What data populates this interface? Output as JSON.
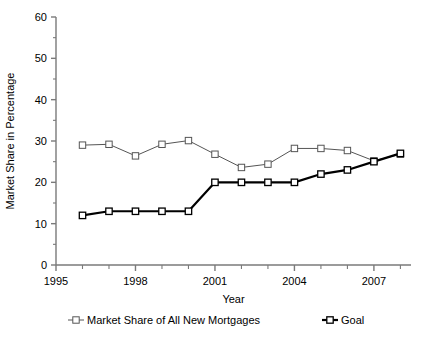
{
  "chart_data": {
    "type": "line",
    "title": "",
    "xlabel": "Year",
    "ylabel": "Market Share in Percentage",
    "xlim": [
      1995,
      2008.4
    ],
    "ylim": [
      0,
      60
    ],
    "ytick_labels": [
      "0",
      "10",
      "20",
      "30",
      "40",
      "50",
      "60"
    ],
    "ytick_values": [
      0,
      10,
      20,
      30,
      40,
      50,
      60
    ],
    "xtick_labels": [
      "1995",
      "1998",
      "2001",
      "2004",
      "2007"
    ],
    "xtick_values": [
      1995,
      1998,
      2001,
      2004,
      2007
    ],
    "xminor_values": [
      1996,
      1997,
      1999,
      2000,
      2002,
      2003,
      2005,
      2006,
      2008
    ],
    "grid": false,
    "legend_position": "bottom",
    "series": [
      {
        "name": "Market Share of All New Mortgages",
        "color": "#555555",
        "line_width": 1,
        "marker": "open-square",
        "x": [
          1996,
          1997,
          1998,
          1999,
          2000,
          2001,
          2002,
          2003,
          2004,
          2005,
          2006,
          2007,
          2008
        ],
        "values": [
          29,
          29.2,
          26.4,
          29.2,
          30.1,
          26.8,
          23.6,
          24.4,
          28.2,
          28.2,
          27.7,
          25.2,
          26.8
        ]
      },
      {
        "name": "Goal",
        "color": "#000000",
        "line_width": 2.2,
        "marker": "open-square",
        "x": [
          1996,
          1997,
          1998,
          1999,
          2000,
          2001,
          2002,
          2003,
          2004,
          2005,
          2006,
          2007,
          2008
        ],
        "values": [
          12,
          13,
          13,
          13,
          13,
          20,
          20,
          20,
          20,
          22,
          23,
          25,
          27
        ]
      }
    ]
  },
  "legend": {
    "entries": [
      {
        "label": "Market Share of All New Mortgages"
      },
      {
        "label": "Goal"
      }
    ]
  }
}
